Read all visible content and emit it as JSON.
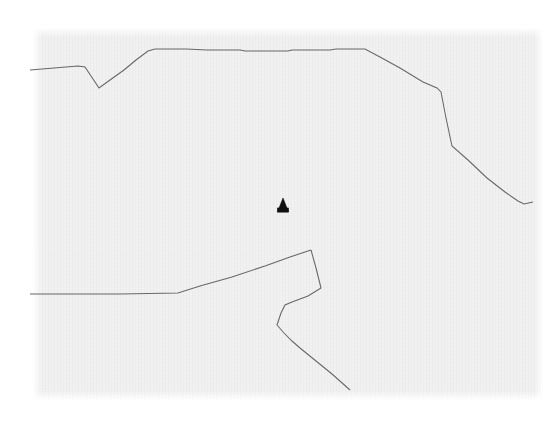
{
  "document": {
    "kind": "scanned-map-fragment",
    "title": "Scanned boundary map fragment",
    "paper_color": "#f2f2f2",
    "page_color": "#ffffff",
    "ink_color": "#5b5b5b",
    "marker_color": "#101010",
    "canvas": {
      "width": 560,
      "height": 424
    },
    "scan_area": {
      "x": 33,
      "y": 28,
      "width": 510,
      "height": 372
    }
  },
  "map": {
    "features": [
      {
        "name": "northern-boundary-line",
        "role": "boundary",
        "stroke": "#5b5b5b",
        "points": "30,70 78,66 85,67 99,88 110,80 124,70 136,60 148,51 155,49 186,49 207,50 240,50 245,51 288,51 292,50 330,50 336,49 365,49 380,57 400,68 423,82 437,88 441,92 446,118 452,146 468,160 487,178 505,192 518,201 524,204 533,202"
      },
      {
        "name": "western-horizontal-boundary",
        "role": "boundary",
        "stroke": "#5b5b5b",
        "points": "30,294 120,294 178,293 200,286 232,277 265,266 290,257 308,251 311,250"
      },
      {
        "name": "eastern-loop-boundary",
        "role": "boundary",
        "stroke": "#5b5b5b",
        "points": "311,250 316,268 320,284 321,288 308,296 292,302 285,305 281,313 277,325 284,333 292,341 300,348 316,361 332,374 350,390"
      }
    ],
    "markers": [
      {
        "name": "site-marker",
        "symbol": "filled-triangle",
        "x": 283,
        "y": 205,
        "width": 11,
        "height": 14,
        "color": "#101010"
      }
    ]
  }
}
